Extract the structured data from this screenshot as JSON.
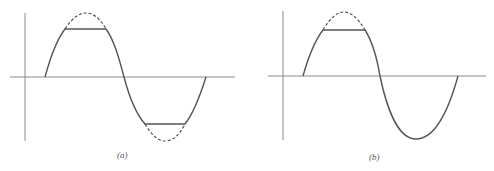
{
  "figure": {
    "panels": [
      {
        "label": "(a)",
        "description": "Sine wave clipped symmetrically at both positive and negative peaks; clipped portions shown dashed"
      },
      {
        "label": "(b)",
        "description": "Sine wave clipped only at positive peak; negative half-cycle intact"
      }
    ]
  },
  "colors": {
    "curve": "#555555",
    "axis": "#8a8a8a",
    "background": "#ffffff"
  }
}
